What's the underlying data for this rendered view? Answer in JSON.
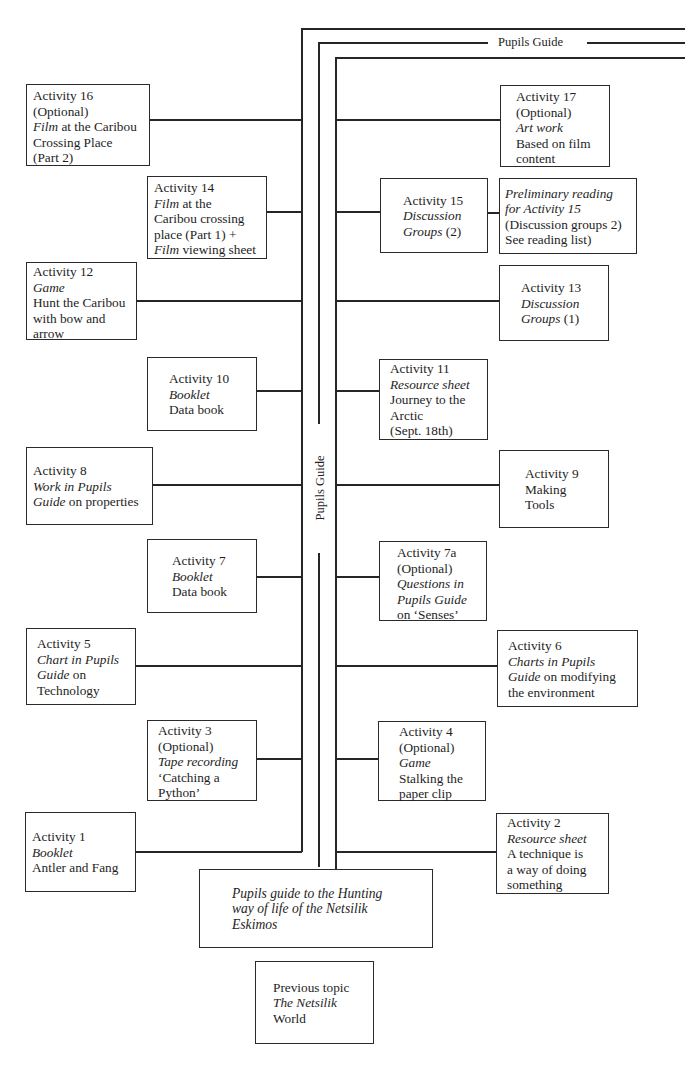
{
  "spine": {
    "top_label": "Pupils Guide",
    "vertical_label": "Pupils Guide"
  },
  "left_column": [
    {
      "id": "activity-16",
      "lines": [
        {
          "t": "Activity 16"
        },
        {
          "t": "(Optional)"
        },
        {
          "parts": [
            {
              "t": "Film",
              "i": true
            },
            {
              "t": " at the Caribou"
            }
          ]
        },
        {
          "t": "Crossing Place"
        },
        {
          "t": "(Part 2)"
        }
      ]
    },
    {
      "id": "activity-14",
      "lines": [
        {
          "t": "Activity 14"
        },
        {
          "parts": [
            {
              "t": "Film",
              "i": true
            },
            {
              "t": " at the"
            }
          ]
        },
        {
          "t": "Caribou crossing"
        },
        {
          "t": "place (Part 1) +"
        },
        {
          "parts": [
            {
              "t": "Film",
              "i": true
            },
            {
              "t": " viewing sheet"
            }
          ]
        }
      ]
    },
    {
      "id": "activity-12",
      "lines": [
        {
          "t": "Activity 12"
        },
        {
          "t": "Game",
          "i": true
        },
        {
          "t": "Hunt the Caribou"
        },
        {
          "t": "with bow and"
        },
        {
          "t": "arrow"
        }
      ]
    },
    {
      "id": "activity-10",
      "lines": [
        {
          "t": "Activity 10"
        },
        {
          "t": "Booklet",
          "i": true
        },
        {
          "t": "Data book"
        }
      ]
    },
    {
      "id": "activity-8",
      "lines": [
        {
          "t": "Activity 8"
        },
        {
          "t": "Work in Pupils",
          "i": true
        },
        {
          "parts": [
            {
              "t": "Guide",
              "i": true
            },
            {
              "t": " on properties"
            }
          ]
        }
      ]
    },
    {
      "id": "activity-7",
      "lines": [
        {
          "t": "Activity 7"
        },
        {
          "t": "Booklet",
          "i": true
        },
        {
          "t": "Data book"
        }
      ]
    },
    {
      "id": "activity-5",
      "lines": [
        {
          "t": "Activity 5"
        },
        {
          "t": "Chart in Pupils",
          "i": true
        },
        {
          "parts": [
            {
              "t": "Guide",
              "i": true
            },
            {
              "t": " on"
            }
          ]
        },
        {
          "t": "Technology"
        }
      ]
    },
    {
      "id": "activity-3",
      "lines": [
        {
          "t": "Activity 3"
        },
        {
          "t": "(Optional)"
        },
        {
          "t": "Tape recording",
          "i": true
        },
        {
          "t": "‘Catching a"
        },
        {
          "t": "Python’"
        }
      ]
    },
    {
      "id": "activity-1",
      "lines": [
        {
          "t": "Activity 1"
        },
        {
          "t": "Booklet",
          "i": true
        },
        {
          "t": "Antler and Fang"
        }
      ]
    }
  ],
  "right_column": [
    {
      "id": "activity-17",
      "lines": [
        {
          "t": "Activity 17"
        },
        {
          "t": "(Optional)"
        },
        {
          "t": "Art work",
          "i": true
        },
        {
          "t": "Based on film"
        },
        {
          "t": "content"
        }
      ]
    },
    {
      "id": "activity-15",
      "lines": [
        {
          "t": "Activity 15"
        },
        {
          "t": "Discussion",
          "i": true
        },
        {
          "parts": [
            {
              "t": "Groups",
              "i": true
            },
            {
              "t": " (2)"
            }
          ]
        }
      ]
    },
    {
      "id": "preliminary-reading",
      "lines": [
        {
          "t": "Preliminary reading",
          "i": true
        },
        {
          "t": "for Activity 15",
          "i": true
        },
        {
          "t": "(Discussion groups 2)"
        },
        {
          "t": "See reading list)"
        }
      ]
    },
    {
      "id": "activity-13",
      "lines": [
        {
          "t": "Activity 13"
        },
        {
          "t": "Discussion",
          "i": true
        },
        {
          "parts": [
            {
              "t": "Groups",
              "i": true
            },
            {
              "t": " (1)"
            }
          ]
        }
      ]
    },
    {
      "id": "activity-11",
      "lines": [
        {
          "t": "Activity 11"
        },
        {
          "t": "Resource sheet",
          "i": true
        },
        {
          "t": "Journey to the"
        },
        {
          "t": "Arctic"
        },
        {
          "t": "(Sept. 18th)"
        }
      ]
    },
    {
      "id": "activity-9",
      "lines": [
        {
          "t": "Activity 9"
        },
        {
          "t": "Making"
        },
        {
          "t": "Tools"
        }
      ]
    },
    {
      "id": "activity-7a",
      "lines": [
        {
          "t": "Activity 7a"
        },
        {
          "t": "(Optional)"
        },
        {
          "t": "Questions in",
          "i": true
        },
        {
          "t": "Pupils Guide",
          "i": true
        },
        {
          "t": "on ‘Senses’"
        }
      ]
    },
    {
      "id": "activity-6",
      "lines": [
        {
          "t": "Activity 6"
        },
        {
          "t": "Charts in Pupils",
          "i": true
        },
        {
          "parts": [
            {
              "t": "Guide",
              "i": true
            },
            {
              "t": " on modifying"
            }
          ]
        },
        {
          "t": "the environment"
        }
      ]
    },
    {
      "id": "activity-4",
      "lines": [
        {
          "t": "Activity 4"
        },
        {
          "t": "(Optional)"
        },
        {
          "t": "Game",
          "i": true
        },
        {
          "t": "Stalking the"
        },
        {
          "t": "paper clip"
        }
      ]
    },
    {
      "id": "activity-2",
      "lines": [
        {
          "t": "Activity 2"
        },
        {
          "t": "Resource sheet",
          "i": true
        },
        {
          "t": "A technique is"
        },
        {
          "t": "a way of doing"
        },
        {
          "t": "something"
        }
      ]
    }
  ],
  "base": {
    "central": {
      "id": "pupils-guide-central",
      "lines": [
        {
          "t": "Pupils guide to the Hunting",
          "i": true
        },
        {
          "t": "way of life of the Netsilik",
          "i": true
        },
        {
          "t": "Eskimos",
          "i": true
        }
      ]
    },
    "previous": {
      "id": "previous-topic",
      "lines": [
        {
          "t": "Previous topic"
        },
        {
          "t": "The Netsilik",
          "i": true
        },
        {
          "t": "World"
        }
      ]
    }
  }
}
